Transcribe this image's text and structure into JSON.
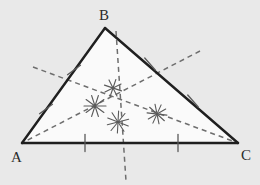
{
  "figure": {
    "background_color": "#e9e9e9",
    "interior_fill": "#fafafa",
    "side_color": "#1f1f1f",
    "bisector_color": "#6e6e6e",
    "arc_color": "#5a5a5a",
    "tick_color": "#5a5a5a",
    "label_color": "#2b2b2b"
  },
  "vertices": [
    {
      "name": "A",
      "label": "A",
      "x": 22,
      "y": 143,
      "label_x": 11,
      "label_y": 150
    },
    {
      "name": "B",
      "label": "B",
      "x": 105,
      "y": 28,
      "label_x": 99,
      "label_y": 8
    },
    {
      "name": "C",
      "label": "C",
      "x": 238,
      "y": 143,
      "label_x": 241,
      "label_y": 148
    }
  ],
  "sides": [
    {
      "name": "side-ab",
      "from": "A",
      "to": "B",
      "x1": 22,
      "y1": 143,
      "x2": 105,
      "y2": 28
    },
    {
      "name": "side-bc",
      "from": "B",
      "to": "C",
      "x1": 105,
      "y1": 28,
      "x2": 238,
      "y2": 143
    },
    {
      "name": "side-ac",
      "from": "A",
      "to": "C",
      "x1": 22,
      "y1": 143,
      "x2": 238,
      "y2": 143
    }
  ],
  "midpoints": [
    {
      "name": "midpoint-ab",
      "side": "AB",
      "x": 63.5,
      "y": 85.5
    },
    {
      "name": "midpoint-bc",
      "side": "BC",
      "x": 171.5,
      "y": 85.5
    },
    {
      "name": "midpoint-ac",
      "side": "AC",
      "x": 130,
      "y": 143
    }
  ],
  "circumcenter": {
    "name": "circumcenter",
    "x": 130,
    "y": 105,
    "label": ""
  },
  "bisectors": [
    {
      "name": "perpendicular-bisector-ab",
      "of_side": "AB",
      "x1": 33,
      "y1": 67,
      "x2": 238,
      "y2": 143,
      "dash": "5,4"
    },
    {
      "name": "perpendicular-bisector-bc",
      "of_side": "BC",
      "x1": 200,
      "y1": 51,
      "x2": 22,
      "y2": 143,
      "dash": "5,4"
    },
    {
      "name": "perpendicular-bisector-ac",
      "of_side": "AC",
      "x1": 116,
      "y1": 31,
      "x2": 126,
      "y2": 181,
      "dash": "5,4"
    }
  ],
  "tick_marks": [
    {
      "name": "tick-ab-lower",
      "x": 46,
      "y": 109,
      "angle": 54,
      "length": 16
    },
    {
      "name": "tick-ab-upper",
      "x": 74,
      "y": 70,
      "angle": 54,
      "length": 16
    },
    {
      "name": "tick-bc-upper",
      "x": 150,
      "y": 64,
      "angle": -41,
      "length": 16
    },
    {
      "name": "tick-bc-lower",
      "x": 193,
      "y": 101,
      "angle": -41,
      "length": 16
    },
    {
      "name": "tick-ac-left",
      "x": 85,
      "y": 143,
      "angle": 0,
      "length": 17
    },
    {
      "name": "tick-ac-right",
      "x": 178,
      "y": 143,
      "angle": 0,
      "length": 17
    }
  ],
  "construction_arcs": [
    {
      "name": "arc-cluster-left",
      "x": 95,
      "y": 106,
      "radius": 11,
      "strokes": 5
    },
    {
      "name": "arc-cluster-center",
      "x": 118,
      "y": 122,
      "radius": 11,
      "strokes": 5
    },
    {
      "name": "arc-cluster-right",
      "x": 157,
      "y": 114,
      "radius": 10,
      "strokes": 5
    },
    {
      "name": "arc-cluster-upper",
      "x": 113,
      "y": 88,
      "radius": 9,
      "strokes": 4
    }
  ]
}
